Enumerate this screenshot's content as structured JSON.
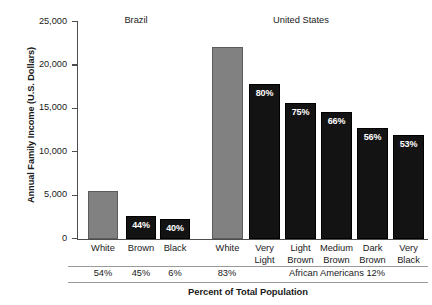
{
  "chart_data": {
    "type": "bar",
    "title": "",
    "xlabel": "Percent of Total Population",
    "ylabel": "Annual Family Income (U.S. Dollars)",
    "ylim": [
      0,
      25000
    ],
    "yticks": [
      0,
      5000,
      10000,
      15000,
      20000,
      25000
    ],
    "ytick_labels": [
      "0",
      "5,000",
      "10,000",
      "15,000",
      "20,000",
      "25,000"
    ],
    "grid": false,
    "legend": "none",
    "groups": [
      {
        "name": "Brazil",
        "label": "Brazil"
      },
      {
        "name": "United States",
        "label": "United States"
      }
    ],
    "categories": [
      "White",
      "Brown",
      "Black",
      "White",
      "Very Light",
      "Light Brown",
      "Medium Brown",
      "Dark Brown",
      "Very Black"
    ],
    "values": [
      5400,
      2600,
      2300,
      21200,
      17000,
      15800,
      14000,
      12000,
      11200
    ],
    "bar_labels": [
      "",
      "44%",
      "40%",
      "",
      "80%",
      "75%",
      "66%",
      "56%",
      "53%"
    ],
    "population_percents": [
      "54%",
      "45%",
      "6%",
      "83%",
      "African Americans 12%"
    ],
    "colors": {
      "white_group": "#818181",
      "other_group": "#131313",
      "axis": "#4d4d4d",
      "rule": "#9a9a9a"
    }
  },
  "bars": [
    {
      "cat_line1": "White",
      "cat_line2": "",
      "value": 5400,
      "label": "",
      "style": "gray",
      "left": 88,
      "width": 30,
      "top": 191,
      "height": 48
    },
    {
      "cat_line1": "Brown",
      "cat_line2": "",
      "value": 2600,
      "label": "44%",
      "style": "black",
      "left": 126,
      "width": 30,
      "top": 216,
      "height": 23
    },
    {
      "cat_line1": "Black",
      "cat_line2": "",
      "value": 2300,
      "label": "40%",
      "style": "black",
      "left": 160,
      "width": 30,
      "top": 219,
      "height": 20
    },
    {
      "cat_line1": "White",
      "cat_line2": "",
      "value": 21200,
      "label": "",
      "style": "gray",
      "left": 212,
      "width": 31,
      "top": 47,
      "height": 192
    },
    {
      "cat_line1": "Very",
      "cat_line2": "Light",
      "value": 17000,
      "label": "80%",
      "style": "black",
      "left": 249,
      "width": 31,
      "top": 84,
      "height": 155
    },
    {
      "cat_line1": "Light",
      "cat_line2": "Brown",
      "value": 15800,
      "label": "75%",
      "style": "black",
      "left": 285,
      "width": 31,
      "top": 103,
      "height": 136
    },
    {
      "cat_line1": "Medium",
      "cat_line2": "Brown",
      "value": 14000,
      "label": "66%",
      "style": "black",
      "left": 321,
      "width": 31,
      "top": 112,
      "height": 127
    },
    {
      "cat_line1": "Dark",
      "cat_line2": "Brown",
      "value": 12000,
      "label": "56%",
      "style": "black",
      "left": 357,
      "width": 31,
      "top": 128,
      "height": 111
    },
    {
      "cat_line1": "Very",
      "cat_line2": "Black",
      "value": 11200,
      "label": "53%",
      "style": "black",
      "left": 393,
      "width": 31,
      "top": 135,
      "height": 104
    }
  ],
  "yticks": [
    {
      "label": "25,000",
      "top": 21
    },
    {
      "label": "20,000",
      "top": 64.4
    },
    {
      "label": "15,000",
      "top": 107.8
    },
    {
      "label": "10,000",
      "top": 151.2
    },
    {
      "label": "5,000",
      "top": 194.6
    },
    {
      "label": "0",
      "top": 238
    }
  ],
  "population": [
    {
      "text": "54%",
      "left": 83,
      "width": 40
    },
    {
      "text": "45%",
      "left": 121,
      "width": 40
    },
    {
      "text": "6%",
      "left": 155,
      "width": 40
    },
    {
      "text": "83%",
      "left": 207,
      "width": 40
    },
    {
      "text": "African Americans 12%",
      "left": 249,
      "width": 176
    }
  ]
}
